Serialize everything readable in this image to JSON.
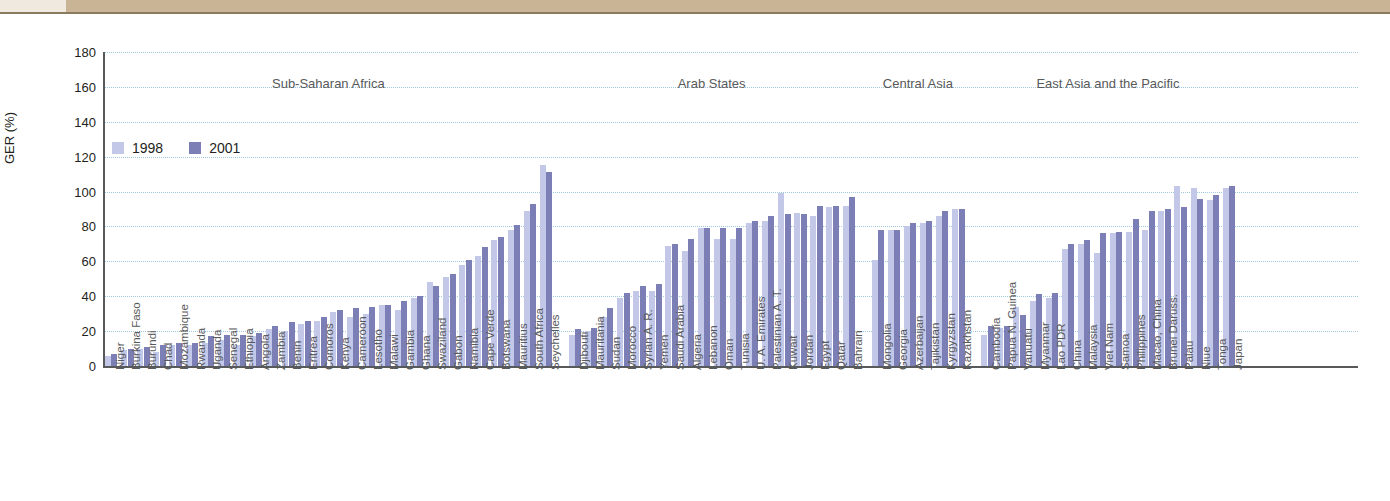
{
  "chart_data": {
    "type": "bar",
    "title": "",
    "xlabel": "",
    "ylabel": "GER (%)",
    "ylim": [
      0,
      180
    ],
    "yticks": [
      0,
      20,
      40,
      60,
      80,
      100,
      120,
      140,
      160,
      180
    ],
    "grid": true,
    "legend_position": "top-left",
    "series": [
      {
        "name": "1998",
        "color": "#c3c8e8"
      },
      {
        "name": "2001",
        "color": "#7b7fb5"
      }
    ],
    "regions": [
      {
        "name": "Sub-Saharan Africa",
        "countries": [
          {
            "label": "Niger",
            "v1998": 6,
            "v2001": 7
          },
          {
            "label": "Burkina Faso",
            "v1998": 9,
            "v2001": 10
          },
          {
            "label": "Burundi",
            "v1998": 10,
            "v2001": 11
          },
          {
            "label": "Chad",
            "v1998": 8,
            "v2001": 12
          },
          {
            "label": "Mozambique",
            "v1998": 12,
            "v2001": 13
          },
          {
            "label": "Rwanda",
            "v1998": 12,
            "v2001": 13
          },
          {
            "label": "Uganda",
            "v1998": 13,
            "v2001": 17
          },
          {
            "label": "Senegal",
            "v1998": 15,
            "v2001": 18
          },
          {
            "label": "Ethiopia",
            "v1998": 12,
            "v2001": 18
          },
          {
            "label": "Angola",
            "v1998": 17,
            "v2001": 19
          },
          {
            "label": "Zambia",
            "v1998": 21,
            "v2001": 23
          },
          {
            "label": "Benin",
            "v1998": 20,
            "v2001": 25
          },
          {
            "label": "Eritrea",
            "v1998": 24,
            "v2001": 26
          },
          {
            "label": "Comoros",
            "v1998": 26,
            "v2001": 28
          },
          {
            "label": "Kenya",
            "v1998": 31,
            "v2001": 32
          },
          {
            "label": "Cameroon",
            "v1998": 28,
            "v2001": 33
          },
          {
            "label": "Lesotho",
            "v1998": 30,
            "v2001": 34
          },
          {
            "label": "Malawi",
            "v1998": 35,
            "v2001": 35
          },
          {
            "label": "Gambia",
            "v1998": 32,
            "v2001": 37
          },
          {
            "label": "Ghana",
            "v1998": 39,
            "v2001": 40
          },
          {
            "label": "Swaziland",
            "v1998": 48,
            "v2001": 46
          },
          {
            "label": "Gabon",
            "v1998": 51,
            "v2001": 53
          },
          {
            "label": "Namibia",
            "v1998": 58,
            "v2001": 61
          },
          {
            "label": "Cape Verde",
            "v1998": 63,
            "v2001": 68
          },
          {
            "label": "Botswana",
            "v1998": 72,
            "v2001": 74
          },
          {
            "label": "Mauritius",
            "v1998": 78,
            "v2001": 81
          },
          {
            "label": "South Africa",
            "v1998": 89,
            "v2001": 93
          },
          {
            "label": "Seychelles",
            "v1998": 115,
            "v2001": 111
          }
        ]
      },
      {
        "name": "Arab States",
        "countries": [
          {
            "label": "Djibouti",
            "v1998": 18,
            "v2001": 21
          },
          {
            "label": "Mauritania",
            "v1998": 20,
            "v2001": 22
          },
          {
            "label": "Sudan",
            "v1998": 28,
            "v2001": 33
          },
          {
            "label": "Morocco",
            "v1998": 39,
            "v2001": 42
          },
          {
            "label": "Syrian A. R.",
            "v1998": 43,
            "v2001": 46
          },
          {
            "label": "Yemen",
            "v1998": 43,
            "v2001": 47
          },
          {
            "label": "Saudi Arabia",
            "v1998": 69,
            "v2001": 70
          },
          {
            "label": "Algeria",
            "v1998": 66,
            "v2001": 73
          },
          {
            "label": "Lebanon",
            "v1998": 79,
            "v2001": 79
          },
          {
            "label": "Oman",
            "v1998": 73,
            "v2001": 79
          },
          {
            "label": "Tunisia",
            "v1998": 73,
            "v2001": 79
          },
          {
            "label": "U. A. Emirates",
            "v1998": 82,
            "v2001": 83
          },
          {
            "label": "Palestinian A. T.",
            "v1998": 83,
            "v2001": 86
          },
          {
            "label": "Kuwait",
            "v1998": 99,
            "v2001": 87
          },
          {
            "label": "Jordan",
            "v1998": 88,
            "v2001": 87
          },
          {
            "label": "Egypt",
            "v1998": 86,
            "v2001": 92
          },
          {
            "label": "Qatar",
            "v1998": 91,
            "v2001": 92
          },
          {
            "label": "Bahrain",
            "v1998": 92,
            "v2001": 97
          }
        ]
      },
      {
        "name": "Central Asia",
        "countries": [
          {
            "label": "Mongolia",
            "v1998": 61,
            "v2001": 78
          },
          {
            "label": "Georgia",
            "v1998": 78,
            "v2001": 78
          },
          {
            "label": "Azerbaijan",
            "v1998": 80,
            "v2001": 82
          },
          {
            "label": "Tajikistan",
            "v1998": 82,
            "v2001": 83
          },
          {
            "label": "Kyrgyzstan",
            "v1998": 86,
            "v2001": 89
          },
          {
            "label": "Kazakhstan",
            "v1998": 90,
            "v2001": 90
          }
        ]
      },
      {
        "name": "East Asia and the Pacific",
        "countries": [
          {
            "label": "Cambodia",
            "v1998": 18,
            "v2001": 23
          },
          {
            "label": "Papua N. Guinea",
            "v1998": 22,
            "v2001": 23
          },
          {
            "label": "Vanuatu",
            "v1998": 34,
            "v2001": 29
          },
          {
            "label": "Myanmar",
            "v1998": 37,
            "v2001": 41
          },
          {
            "label": "Lao PDR",
            "v1998": 39,
            "v2001": 42
          },
          {
            "label": "China",
            "v1998": 67,
            "v2001": 70
          },
          {
            "label": "Malaysia",
            "v1998": 70,
            "v2001": 72
          },
          {
            "label": "Viet Nam",
            "v1998": 65,
            "v2001": 76
          },
          {
            "label": "Samoa",
            "v1998": 76,
            "v2001": 77
          },
          {
            "label": "Philippines",
            "v1998": 77,
            "v2001": 84
          },
          {
            "label": "Macao, China",
            "v1998": 78,
            "v2001": 89
          },
          {
            "label": "Brunei Daruss.",
            "v1998": 89,
            "v2001": 90
          },
          {
            "label": "Palau",
            "v1998": 103,
            "v2001": 91
          },
          {
            "label": "Niue",
            "v1998": 102,
            "v2001": 96
          },
          {
            "label": "Tonga",
            "v1998": 95,
            "v2001": 98
          },
          {
            "label": "Japan",
            "v1998": 102,
            "v2001": 103
          }
        ]
      }
    ]
  }
}
